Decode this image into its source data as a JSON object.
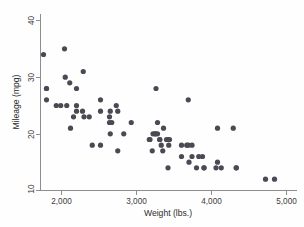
{
  "chart_data": {
    "type": "scatter",
    "title": "",
    "subtitle": "",
    "xlabel": "Weight (lbs.)",
    "ylabel": "Mileage (mpg)",
    "xlim": [
      1700,
      5000
    ],
    "ylim": [
      9,
      42
    ],
    "xticks": [
      2000,
      3000,
      4000,
      5000
    ],
    "xtick_labels": [
      "2,000",
      "3,000",
      "4,000",
      "5,000"
    ],
    "yticks": [
      10,
      20,
      30,
      40
    ],
    "ytick_labels": [
      "10",
      "20",
      "30",
      "40"
    ],
    "grid": false,
    "legend": false,
    "marker_color": "#4a4a55",
    "marker_size": 2.6,
    "background_color": "#fefefe",
    "axis_color": "#8d8d8d",
    "n_points": 74,
    "series": [
      {
        "name": "cars",
        "points": [
          [
            2930,
            22
          ],
          [
            3350,
            17
          ],
          [
            2640,
            22
          ],
          [
            3250,
            20
          ],
          [
            4080,
            15
          ],
          [
            3670,
            18
          ],
          [
            3690,
            26
          ],
          [
            3280,
            20
          ],
          [
            3880,
            16
          ],
          [
            3400,
            19
          ],
          [
            4330,
            14
          ],
          [
            3900,
            14
          ],
          [
            4290,
            21
          ],
          [
            4080,
            21
          ],
          [
            3700,
            15
          ],
          [
            2110,
            29
          ],
          [
            2200,
            28
          ],
          [
            2280,
            24
          ],
          [
            1800,
            26
          ],
          [
            2040,
            35
          ],
          [
            1800,
            28
          ],
          [
            1800,
            28
          ],
          [
            2670,
            22
          ],
          [
            2370,
            23
          ],
          [
            2200,
            24
          ],
          [
            2520,
            26
          ],
          [
            2300,
            23
          ],
          [
            2830,
            20
          ],
          [
            2070,
            25
          ],
          [
            3740,
            18
          ],
          [
            1760,
            34
          ],
          [
            2050,
            30
          ],
          [
            2410,
            18
          ],
          [
            2520,
            24
          ],
          [
            3330,
            18
          ],
          [
            2290,
            31
          ],
          [
            2200,
            25
          ],
          [
            2520,
            18
          ],
          [
            2650,
            24
          ],
          [
            2750,
            24
          ],
          [
            3420,
            14
          ],
          [
            3210,
            17
          ],
          [
            3310,
            19
          ],
          [
            3310,
            19
          ],
          [
            3440,
            19
          ],
          [
            3280,
            22
          ],
          [
            3430,
            18
          ],
          [
            3260,
            28
          ],
          [
            3690,
            18
          ],
          [
            3180,
            19
          ],
          [
            3420,
            19
          ],
          [
            3360,
            21
          ],
          [
            4330,
            14
          ],
          [
            4720,
            12
          ],
          [
            4840,
            12
          ],
          [
            3600,
            18
          ],
          [
            3740,
            16
          ],
          [
            3800,
            14
          ],
          [
            3900,
            14
          ],
          [
            4060,
            14
          ],
          [
            4130,
            14
          ],
          [
            3170,
            19
          ],
          [
            3220,
            20
          ],
          [
            3250,
            20
          ],
          [
            3600,
            16
          ],
          [
            3830,
            16
          ],
          [
            2730,
            25
          ],
          [
            2640,
            23
          ],
          [
            1930,
            25
          ],
          [
            1990,
            25
          ],
          [
            2160,
            23
          ],
          [
            2120,
            21
          ],
          [
            2650,
            20
          ],
          [
            2750,
            17
          ]
        ]
      }
    ]
  },
  "axes": {
    "ylabel": "Mileage (mpg)",
    "xlabel": "Weight (lbs.)",
    "ytick_0": "10",
    "ytick_1": "20",
    "ytick_2": "30",
    "ytick_3": "40",
    "xtick_0": "2,000",
    "xtick_1": "3,000",
    "xtick_2": "4,000",
    "xtick_3": "5,000"
  }
}
